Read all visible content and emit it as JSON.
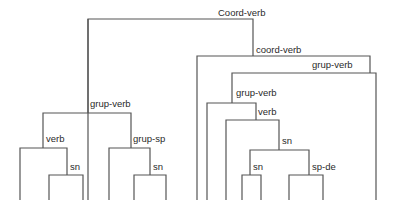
{
  "diagram": {
    "type": "syntax-tree",
    "line_color": "#555555",
    "labels": {
      "root": "Coord-verb",
      "left_grup_verb": "grup-verb",
      "left_verb": "verb",
      "left_verb_sn": "sn",
      "left_grup_sp": "grup-sp",
      "left_grup_sp_sn": "sn",
      "right_coord_verb": "coord-verb",
      "right_grup_verb_outer": "grup-verb",
      "right_grup_verb_inner": "grup-verb",
      "right_verb": "verb",
      "right_sn_outer": "sn",
      "right_sn_inner": "sn",
      "right_sp_de": "sp-de"
    }
  }
}
